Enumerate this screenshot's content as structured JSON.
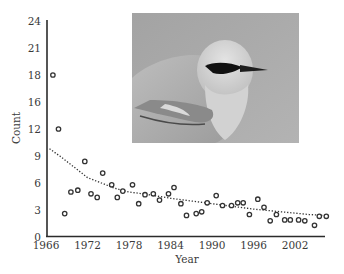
{
  "chart_data": {
    "type": "scatter",
    "title": "",
    "xlabel": "Year",
    "ylabel": "Count",
    "xlim": [
      1966,
      2006.2
    ],
    "ylim": [
      0,
      24
    ],
    "x_ticks": [
      1966,
      1972,
      1978,
      1984,
      1990,
      1996,
      2002
    ],
    "x_tick_labels": [
      "1966",
      "1972",
      "1978",
      "1984",
      "1990",
      "1996",
      "2002"
    ],
    "y_ticks": [
      0,
      3,
      6,
      9,
      12,
      15,
      18,
      21,
      24
    ],
    "y_tick_labels": [
      "0",
      "3",
      "6",
      "9",
      "12",
      "16",
      "18",
      "21",
      "24"
    ],
    "grid": false,
    "legend": null,
    "series": [
      {
        "name": "Observed count",
        "style": "open-circle",
        "x": [
          1967.0,
          1967.8,
          1968.7,
          1969.6,
          1970.6,
          1971.6,
          1972.5,
          1973.4,
          1974.2,
          1975.5,
          1976.3,
          1977.1,
          1978.5,
          1979.4,
          1980.3,
          1981.5,
          1982.4,
          1983.7,
          1984.5,
          1985.5,
          1986.3,
          1987.7,
          1988.5,
          1989.3,
          1990.6,
          1991.5,
          1992.8,
          1993.7,
          1994.5,
          1995.4,
          1996.6,
          1997.5,
          1998.4,
          1999.3,
          2000.5,
          2001.3,
          2002.5,
          2003.4,
          2004.8,
          2005.5,
          2006.5
        ],
        "y": [
          18.0,
          12.0,
          2.6,
          5.0,
          5.2,
          8.4,
          4.8,
          4.4,
          7.1,
          5.8,
          4.4,
          5.1,
          5.8,
          3.7,
          4.7,
          4.8,
          4.1,
          4.8,
          5.5,
          3.7,
          2.4,
          2.6,
          2.8,
          3.8,
          4.6,
          3.5,
          3.5,
          3.8,
          3.8,
          2.5,
          4.2,
          3.3,
          1.8,
          2.5,
          1.9,
          1.9,
          1.9,
          1.8,
          1.3,
          2.3,
          2.3
        ]
      },
      {
        "name": "Trend",
        "style": "dotted-line",
        "x": [
          1966.5,
          1968,
          1970,
          1972,
          1974,
          1975,
          1976,
          1978,
          1980,
          1984,
          1988,
          1992,
          1996,
          2000,
          2004,
          2006
        ],
        "y": [
          9.8,
          9.0,
          7.8,
          6.6,
          6.0,
          5.7,
          5.4,
          5.0,
          4.8,
          4.3,
          3.9,
          3.5,
          3.1,
          2.8,
          2.5,
          2.4
        ]
      }
    ],
    "annotations": [
      {
        "type": "inset-photo",
        "subject": "bird (grayscale photograph)"
      }
    ]
  },
  "colors": {
    "axis": "#2b2b2b",
    "marker": "#333333",
    "trend": "#333333",
    "text": "#3a3a3a",
    "photo_bg": "#a9a9a9"
  }
}
